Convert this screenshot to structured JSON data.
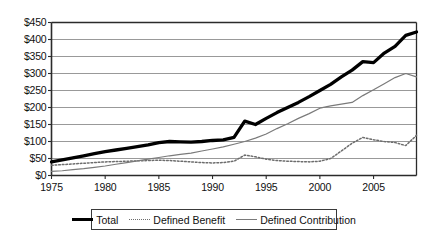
{
  "chart_data": {
    "type": "line",
    "title": "",
    "xlabel": "",
    "ylabel": "",
    "xlim": [
      1975,
      2009
    ],
    "ylim": [
      0,
      450
    ],
    "ytick_step": 50,
    "grid": true,
    "legend_position": "bottom",
    "ytick_labels": [
      "$450",
      "$400",
      "$350",
      "$300",
      "$250",
      "$200",
      "$150",
      "$100",
      "$50",
      "$0"
    ],
    "ytick_values": [
      450,
      400,
      350,
      300,
      250,
      200,
      150,
      100,
      50,
      0
    ],
    "xtick_labels": [
      "1975",
      "1980",
      "1985",
      "1990",
      "1995",
      "2000",
      "2005"
    ],
    "xtick_values": [
      1975,
      1980,
      1985,
      1990,
      1995,
      2000,
      2005
    ],
    "x": [
      1975,
      1976,
      1977,
      1978,
      1979,
      1980,
      1981,
      1982,
      1983,
      1984,
      1985,
      1986,
      1987,
      1988,
      1989,
      1990,
      1991,
      1992,
      1993,
      1994,
      1995,
      1996,
      1997,
      1998,
      1999,
      2000,
      2001,
      2002,
      2003,
      2004,
      2005,
      2006,
      2007,
      2008,
      2009
    ],
    "series": [
      {
        "name": "Total",
        "style": "thick-solid",
        "color": "#000000",
        "values": [
          40,
          46,
          52,
          58,
          64,
          70,
          75,
          80,
          85,
          90,
          97,
          100,
          99,
          98,
          100,
          103,
          105,
          112,
          160,
          150,
          168,
          185,
          200,
          215,
          232,
          250,
          268,
          290,
          310,
          335,
          332,
          360,
          380,
          412,
          422
        ]
      },
      {
        "name": "Defined Benefit",
        "style": "dotted",
        "color": "#6d6d6d",
        "values": [
          30,
          32,
          34,
          36,
          38,
          40,
          41,
          42,
          43,
          44,
          45,
          44,
          42,
          40,
          38,
          37,
          38,
          42,
          60,
          55,
          48,
          44,
          42,
          41,
          40,
          42,
          50,
          72,
          95,
          112,
          105,
          100,
          97,
          88,
          118
        ]
      },
      {
        "name": "Defined Contribution",
        "style": "thin-solid",
        "color": "#7a7a7a",
        "values": [
          12,
          14,
          17,
          20,
          24,
          28,
          33,
          38,
          43,
          48,
          53,
          58,
          62,
          66,
          72,
          78,
          84,
          92,
          100,
          110,
          122,
          138,
          152,
          168,
          182,
          198,
          205,
          210,
          215,
          235,
          252,
          270,
          288,
          300,
          290
        ]
      }
    ]
  },
  "legend": {
    "entries": [
      {
        "label": "Total",
        "style": "total"
      },
      {
        "label": "Defined Benefit",
        "style": "db"
      },
      {
        "label": "Defined Contribution",
        "style": "dc"
      }
    ]
  }
}
